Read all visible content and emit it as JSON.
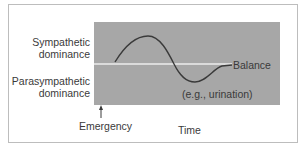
{
  "diagram": {
    "y_labels": {
      "upper_line1": "Sympathetic",
      "upper_line2": "dominance",
      "lower_line1": "Parasympathetic",
      "lower_line2": "dominance"
    },
    "balance_label": "Balance",
    "trough_annotation": "(e.g., urination)",
    "event_label": "Emergency",
    "x_axis_label": "Time",
    "colors": {
      "plot_background": "#a7a7a7",
      "balance_line": "#ececec",
      "curve": "#3a3a3a",
      "text": "#3a3a3a",
      "frame": "#bdbdbd"
    }
  }
}
